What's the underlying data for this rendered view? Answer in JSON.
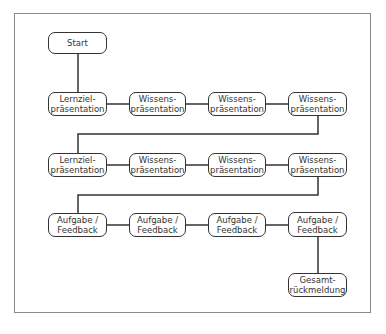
{
  "diagram": {
    "type": "flowchart",
    "nodes": [
      {
        "id": "start",
        "label": "Start"
      },
      {
        "id": "r1c1",
        "label": "Lernziel-\npräsentation"
      },
      {
        "id": "r1c2",
        "label": "Wissens-\npräsentation"
      },
      {
        "id": "r1c3",
        "label": "Wissens-\npräsentation"
      },
      {
        "id": "r1c4",
        "label": "Wissens-\npräsentation"
      },
      {
        "id": "r2c1",
        "label": "Lernziel-\npräsentation"
      },
      {
        "id": "r2c2",
        "label": "Wissens-\npräsentation"
      },
      {
        "id": "r2c3",
        "label": "Wissens-\npräsentation"
      },
      {
        "id": "r2c4",
        "label": "Wissens-\npräsentation"
      },
      {
        "id": "r3c1",
        "label": "Aufgabe /\nFeedback"
      },
      {
        "id": "r3c2",
        "label": "Aufgabe /\nFeedback"
      },
      {
        "id": "r3c3",
        "label": "Aufgabe /\nFeedback"
      },
      {
        "id": "r3c4",
        "label": "Aufgabe /\nFeedback"
      },
      {
        "id": "end",
        "label": "Gesamt-\nrückmeldung"
      }
    ],
    "edges": [
      [
        "start",
        "r1c1"
      ],
      [
        "r1c1",
        "r1c2"
      ],
      [
        "r1c2",
        "r1c3"
      ],
      [
        "r1c3",
        "r1c4"
      ],
      [
        "r1c4",
        "r2c1"
      ],
      [
        "r2c1",
        "r2c2"
      ],
      [
        "r2c2",
        "r2c3"
      ],
      [
        "r2c3",
        "r2c4"
      ],
      [
        "r2c4",
        "r3c1"
      ],
      [
        "r3c1",
        "r3c2"
      ],
      [
        "r3c2",
        "r3c3"
      ],
      [
        "r3c3",
        "r3c4"
      ],
      [
        "r3c4",
        "end"
      ]
    ],
    "colors": {
      "stroke": "#333333",
      "frame": "#8a8a8a",
      "background": "#ffffff"
    }
  }
}
